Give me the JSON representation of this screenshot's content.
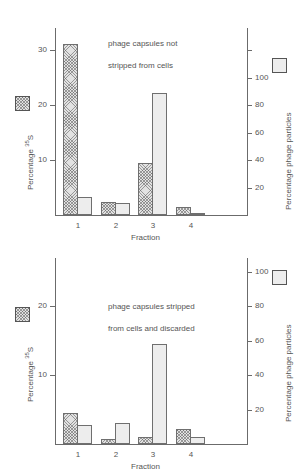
{
  "figure": {
    "background": "#ffffff",
    "line_color": "#6b6b6b",
    "hatched_bar_color": "#e2e2e2",
    "plain_bar_color": "#ededed"
  },
  "axes": {
    "left_title_prefix": "Percentage ",
    "left_title_sup": "35",
    "left_title_suffix": "S",
    "left_title_full": "Percentage 35S",
    "right_title": "Percentage phage particles",
    "x_title": "Fraction"
  },
  "legend": {
    "left_swatch_name": "hatched-swatch",
    "right_swatch_name": "plain-swatch"
  },
  "panels": {
    "top": {
      "annotation": "phage capsules not\nstripped from cells",
      "annotation_line1": "phage capsules not",
      "annotation_line2": "stripped from cells"
    },
    "bottom": {
      "annotation": "phage capsules stripped\nfrom cells and discarded",
      "annotation_line1": "phage capsules stripped",
      "annotation_line2": "from cells and discarded"
    }
  },
  "chart_data": [
    {
      "id": "top-panel",
      "type": "bar",
      "title": "phage capsules not stripped from cells",
      "xlabel": "Fraction",
      "ylabel": "Percentage 35S",
      "y2label": "Percentage phage particles",
      "categories": [
        "1",
        "2",
        "3",
        "4"
      ],
      "grid": false,
      "legend_position": "outside-left-and-right",
      "ylim": [
        0,
        34
      ],
      "yticks": [
        10,
        20,
        30
      ],
      "yticklabels": [
        "10",
        "20",
        "30"
      ],
      "y2lim": [
        0,
        136
      ],
      "y2ticks": [
        20,
        40,
        60,
        80,
        100,
        120
      ],
      "y2ticklabels": [
        "20",
        "40",
        "60",
        "80",
        "100",
        ""
      ],
      "series": [
        {
          "name": "Percentage 35S",
          "axis": "left",
          "fill": "hatched",
          "values": [
            31.0,
            2.3,
            9.5,
            1.5
          ]
        },
        {
          "name": "Percentage phage particles",
          "axis": "right",
          "fill": "plain",
          "values": [
            13.0,
            9.0,
            89.0,
            1.5
          ]
        }
      ]
    },
    {
      "id": "bottom-panel",
      "type": "bar",
      "title": "phage capsules stripped from cells and discarded",
      "xlabel": "Fraction",
      "ylabel": "Percentage 35S",
      "y2label": "Percentage phage particles",
      "categories": [
        "1",
        "2",
        "3",
        "4"
      ],
      "grid": false,
      "legend_position": "outside-left-and-right",
      "ylim": [
        0,
        27
      ],
      "yticks": [
        10,
        20
      ],
      "yticklabels": [
        "10",
        "20"
      ],
      "y2lim": [
        0,
        108
      ],
      "y2ticks": [
        20,
        40,
        60,
        80,
        100
      ],
      "y2ticklabels": [
        "20",
        "40",
        "60",
        "80",
        "100"
      ],
      "series": [
        {
          "name": "Percentage 35S",
          "axis": "left",
          "fill": "hatched",
          "values": [
            4.5,
            0.7,
            1.0,
            2.2
          ]
        },
        {
          "name": "Percentage phage particles",
          "axis": "right",
          "fill": "plain",
          "values": [
            11.0,
            12.0,
            58.0,
            4.0
          ]
        }
      ]
    }
  ]
}
